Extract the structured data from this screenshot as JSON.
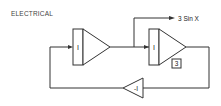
{
  "title": "ELECTRICAL",
  "blocks": {
    "integrator1": {
      "label": "I"
    },
    "integrator2": {
      "label": "I"
    },
    "inverter": {
      "label": "-I"
    },
    "gain_box": {
      "label": "3"
    }
  },
  "output": {
    "label": "3 Sin X"
  },
  "colors": {
    "line": "#333333",
    "background": "#ffffff"
  }
}
